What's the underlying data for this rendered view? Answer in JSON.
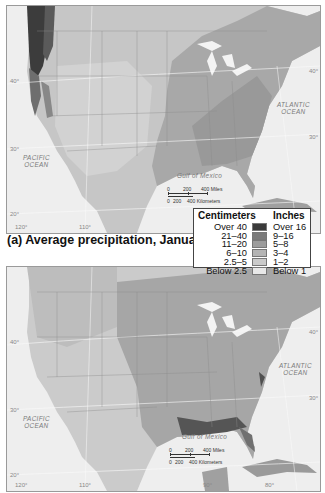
{
  "figure": {
    "maps": [
      {
        "id": "a",
        "caption": "(a) Average precipitation, January",
        "ocean_labels": {
          "pacific": [
            "PACIFIC",
            "OCEAN"
          ],
          "atlantic": [
            "ATLANTIC",
            "OCEAN"
          ],
          "gulf": "Gulf of Mexico"
        },
        "latitude_labels": [
          "40°",
          "30°",
          "20°",
          "40°",
          "30°"
        ],
        "longitude_labels": [
          "120°",
          "110°"
        ],
        "scale_bar": {
          "miles": [
            "0",
            "200",
            "400 Miles"
          ],
          "km": [
            "0",
            "200",
            "400 Kilometers"
          ]
        }
      },
      {
        "id": "b",
        "caption": "",
        "ocean_labels": {
          "pacific": [
            "PACIFIC",
            "OCEAN"
          ],
          "atlantic": [
            "ATLANTIC",
            "OCEAN"
          ],
          "gulf": "Gulf of Mexico"
        },
        "latitude_labels": [
          "40°",
          "30°",
          "20°",
          "40°",
          "30°"
        ],
        "longitude_labels": [
          "120°",
          "110°",
          "90°",
          "80°"
        ],
        "scale_bar": {
          "miles": [
            "0",
            "200",
            "400 Miles"
          ],
          "km": [
            "0",
            "200",
            "400 Kilometers"
          ]
        }
      }
    ],
    "legend": {
      "header_cm": "Centimeters",
      "header_in": "Inches",
      "rows": [
        {
          "cm": "Over 40",
          "in": "Over 16",
          "color": "#3a3a3a"
        },
        {
          "cm": "21–40",
          "in": "9–16",
          "color": "#7a7a7a"
        },
        {
          "cm": "11–20",
          "in": "5–8",
          "color": "#9c9c9c"
        },
        {
          "cm": "6–10",
          "in": "3–4",
          "color": "#b4b4b4"
        },
        {
          "cm": "2.5–5",
          "in": "1–2",
          "color": "#cacaca"
        },
        {
          "cm": "Below 2.5",
          "in": "Below 1",
          "color": "#e8e8e8"
        }
      ]
    }
  }
}
